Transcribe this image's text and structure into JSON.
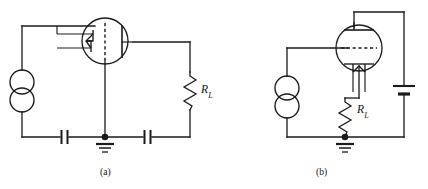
{
  "figure": {
    "type": "schematic-diagram",
    "background_color": "#ffffff",
    "line_color": "#1a1a1a",
    "panels": [
      {
        "id": "a",
        "caption": "(a)",
        "configuration": "grounded-cathode-horizontal-tube",
        "components": [
          {
            "name": "ac-source",
            "symbol": "double-circle",
            "label": ""
          },
          {
            "name": "vacuum-tube",
            "symbol": "triode-envelope-horizontal",
            "label": ""
          },
          {
            "name": "load-resistor",
            "symbol": "zigzag",
            "label": "R",
            "sublabel": "L"
          },
          {
            "name": "input-capacitor",
            "symbol": "parallel-plates",
            "label": ""
          },
          {
            "name": "output-capacitor",
            "symbol": "parallel-plates",
            "label": ""
          },
          {
            "name": "ground",
            "symbol": "earth-ground",
            "label": ""
          }
        ]
      },
      {
        "id": "b",
        "caption": "(b)",
        "configuration": "grounded-plate-vertical-tube",
        "components": [
          {
            "name": "ac-source",
            "symbol": "double-circle",
            "label": ""
          },
          {
            "name": "vacuum-tube",
            "symbol": "triode-envelope-vertical",
            "label": ""
          },
          {
            "name": "load-resistor",
            "symbol": "zigzag",
            "label": "R",
            "sublabel": "L"
          },
          {
            "name": "battery",
            "symbol": "single-cell",
            "label": ""
          },
          {
            "name": "ground",
            "symbol": "earth-ground",
            "label": ""
          }
        ]
      }
    ],
    "labels": {
      "rl_a_main": "R",
      "rl_a_sub": "L",
      "rl_b_main": "R",
      "rl_b_sub": "L",
      "caption_a": "(a)",
      "caption_b": "(b)"
    }
  }
}
